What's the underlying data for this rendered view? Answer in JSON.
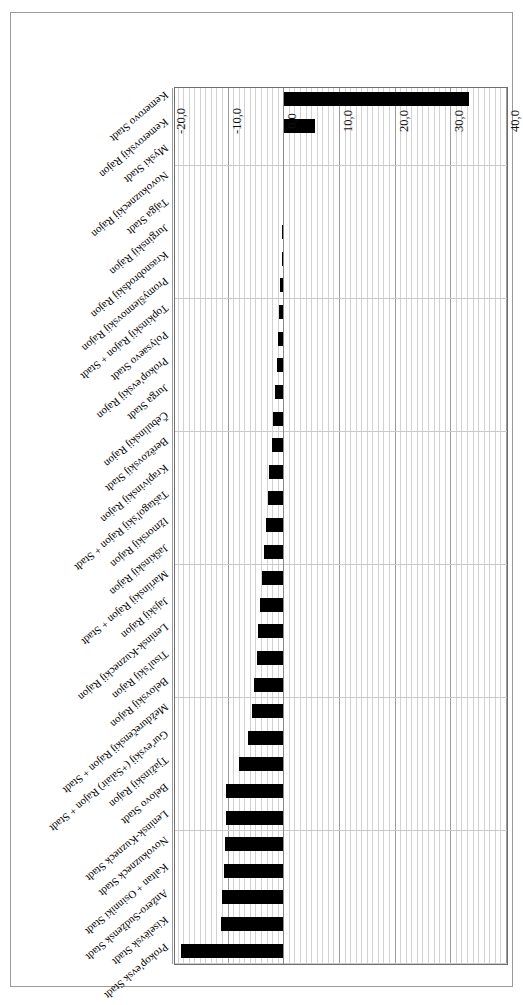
{
  "figure": {
    "orientation": "rotated-180",
    "frame_color": "#9a9a9a",
    "bar_color": "#000000",
    "grid_color": "#c9c9c9",
    "major_grid_color": "#9b9b9b"
  },
  "chart_data": {
    "type": "bar",
    "orientation": "horizontal",
    "title": "",
    "subtitle": "",
    "xlabel": "",
    "ylabel": "",
    "xlim": [
      40.0,
      -20.0
    ],
    "grid": true,
    "legend": null,
    "tick_labels": [
      "40,0",
      "30,0",
      "20,0",
      "10,0",
      "0,0",
      "-10,0",
      "-20,0"
    ],
    "tick_values": [
      40.0,
      30.0,
      20.0,
      10.0,
      0.0,
      -10.0,
      -20.0
    ],
    "major_tick_step": 10.0,
    "minor_tick_step": 1.0,
    "decimal_separator": ",",
    "categories": [
      "Prokop'evsk Stadt",
      "Kiselëvsk Stadt",
      "Anžero-Sudžensk Stadt",
      "Kaltan + Osinniki Stadt",
      "Novokuzneck Stadt",
      "Leninsk-Kuzneck Stadt",
      "Belovo Stadt",
      "Tjažinskij Rajon",
      "Gur'evskij (+Salair) Rajon + Stadt",
      "Meždurečenskij Rajon + Stadt",
      "Belovskij Rajon",
      "Tisul'skij Rajon",
      "Leninsk-Kuzneckij Rajon",
      "Jajskij Rajon",
      "Mariinskij Rajon + Stadt",
      "Jaškinskij Rajon",
      "Ižmorskij Rajon",
      "Taštagol'skij Rajon + Stadt",
      "Krapivinskij Rajon",
      "Berëzovskij Stadt",
      "Čebulinskij Rajon",
      "Jurga Stadt",
      "Prokop'evskij Rajon",
      "Polysaevo Stadt",
      "Topkinskij Rajon + Stadt",
      "Promyšlennovskij Rajon",
      "Krasnobrodskij Rajon",
      "Jurginskij Rajon",
      "Tajga Stadt",
      "Novokuzneckij Rajon",
      "Myski Stadt",
      "Kemerovskij Rajon",
      "Kemerovo Stadt"
    ],
    "values": [
      -18.5,
      -11.3,
      -11.2,
      -10.8,
      -10.6,
      -10.5,
      -10.4,
      -8.2,
      -6.6,
      -5.9,
      -5.4,
      -5.0,
      -4.7,
      -4.3,
      -4.0,
      -3.7,
      -3.3,
      -3.0,
      -2.7,
      -2.3,
      -2.0,
      -1.7,
      -1.4,
      -1.1,
      -0.9,
      -0.7,
      -0.5,
      -0.4,
      -0.3,
      -0.2,
      -0.1,
      5.5,
      33.2
    ]
  }
}
